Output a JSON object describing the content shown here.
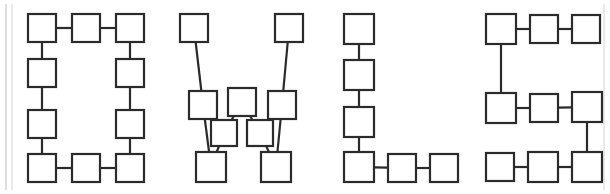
{
  "document": {
    "title": "OWLS node-link letter diagram",
    "caption_text": "OWLS",
    "background_color": "#ffffff",
    "node_fill_color": "#ffffff",
    "node_stroke_color": "#2b2b2b",
    "edge_color": "#2b2b2b",
    "frame_color": "#bdbdbd",
    "stroke_width": 2.2,
    "canvas_width": 610,
    "canvas_height": 194
  },
  "frame": {
    "name": "page-border",
    "left_rule_x": [
      6,
      12
    ],
    "right_rule_x": 604,
    "top_y": 4,
    "bottom_y": 190
  },
  "letters": [
    {
      "id": "letter-o",
      "label": "O",
      "nodes": [
        {
          "id": "o1",
          "x": 28,
          "y": 14,
          "w": 28,
          "h": 28,
          "label": ""
        },
        {
          "id": "o2",
          "x": 72,
          "y": 14,
          "w": 28,
          "h": 28,
          "label": ""
        },
        {
          "id": "o3",
          "x": 116,
          "y": 14,
          "w": 28,
          "h": 28,
          "label": ""
        },
        {
          "id": "o4",
          "x": 28,
          "y": 59,
          "w": 28,
          "h": 28,
          "label": ""
        },
        {
          "id": "o5",
          "x": 116,
          "y": 59,
          "w": 28,
          "h": 28,
          "label": ""
        },
        {
          "id": "o6",
          "x": 28,
          "y": 110,
          "w": 28,
          "h": 28,
          "label": ""
        },
        {
          "id": "o7",
          "x": 116,
          "y": 110,
          "w": 28,
          "h": 28,
          "label": ""
        },
        {
          "id": "o8",
          "x": 28,
          "y": 154,
          "w": 28,
          "h": 28,
          "label": ""
        },
        {
          "id": "o9",
          "x": 72,
          "y": 154,
          "w": 28,
          "h": 28,
          "label": ""
        },
        {
          "id": "o10",
          "x": 116,
          "y": 154,
          "w": 28,
          "h": 28,
          "label": ""
        }
      ],
      "edges": [
        {
          "from": "o1",
          "to": "o2"
        },
        {
          "from": "o2",
          "to": "o3"
        },
        {
          "from": "o1",
          "to": "o4"
        },
        {
          "from": "o4",
          "to": "o6"
        },
        {
          "from": "o6",
          "to": "o8"
        },
        {
          "from": "o8",
          "to": "o9"
        },
        {
          "from": "o9",
          "to": "o10"
        },
        {
          "from": "o3",
          "to": "o5"
        },
        {
          "from": "o5",
          "to": "o7"
        },
        {
          "from": "o7",
          "to": "o10"
        }
      ]
    },
    {
      "id": "letter-w",
      "label": "W",
      "nodes": [
        {
          "id": "w1",
          "x": 180,
          "y": 14,
          "w": 28,
          "h": 28,
          "label": ""
        },
        {
          "id": "w2",
          "x": 275,
          "y": 14,
          "w": 28,
          "h": 28,
          "label": ""
        },
        {
          "id": "w3",
          "x": 189,
          "y": 91,
          "w": 28,
          "h": 28,
          "label": ""
        },
        {
          "id": "w4",
          "x": 228,
          "y": 88,
          "w": 28,
          "h": 28,
          "label": ""
        },
        {
          "id": "w5",
          "x": 268,
          "y": 91,
          "w": 28,
          "h": 28,
          "label": ""
        },
        {
          "id": "w6",
          "x": 211,
          "y": 120,
          "w": 26,
          "h": 26,
          "label": ""
        },
        {
          "id": "w7",
          "x": 247,
          "y": 120,
          "w": 26,
          "h": 26,
          "label": ""
        },
        {
          "id": "w8",
          "x": 196,
          "y": 152,
          "w": 30,
          "h": 30,
          "label": ""
        },
        {
          "id": "w9",
          "x": 261,
          "y": 152,
          "w": 30,
          "h": 30,
          "label": ""
        }
      ],
      "edges": [
        {
          "from": "w1",
          "to": "w3"
        },
        {
          "from": "w3",
          "to": "w8"
        },
        {
          "from": "w8",
          "to": "w6"
        },
        {
          "from": "w6",
          "to": "w4"
        },
        {
          "from": "w4",
          "to": "w7"
        },
        {
          "from": "w7",
          "to": "w9"
        },
        {
          "from": "w9",
          "to": "w5"
        },
        {
          "from": "w5",
          "to": "w2"
        }
      ]
    },
    {
      "id": "letter-l",
      "label": "L",
      "nodes": [
        {
          "id": "l1",
          "x": 344,
          "y": 14,
          "w": 30,
          "h": 30,
          "label": ""
        },
        {
          "id": "l2",
          "x": 344,
          "y": 60,
          "w": 30,
          "h": 30,
          "label": ""
        },
        {
          "id": "l3",
          "x": 344,
          "y": 107,
          "w": 30,
          "h": 30,
          "label": ""
        },
        {
          "id": "l4",
          "x": 344,
          "y": 152,
          "w": 30,
          "h": 30,
          "label": ""
        },
        {
          "id": "l5",
          "x": 388,
          "y": 154,
          "w": 28,
          "h": 28,
          "label": ""
        },
        {
          "id": "l6",
          "x": 430,
          "y": 154,
          "w": 28,
          "h": 28,
          "label": ""
        }
      ],
      "edges": [
        {
          "from": "l1",
          "to": "l2"
        },
        {
          "from": "l2",
          "to": "l3"
        },
        {
          "from": "l3",
          "to": "l4"
        },
        {
          "from": "l4",
          "to": "l5"
        },
        {
          "from": "l5",
          "to": "l6"
        }
      ]
    },
    {
      "id": "letter-s",
      "label": "S",
      "nodes": [
        {
          "id": "s1",
          "x": 486,
          "y": 14,
          "w": 30,
          "h": 30,
          "label": ""
        },
        {
          "id": "s2",
          "x": 530,
          "y": 15,
          "w": 28,
          "h": 28,
          "label": ""
        },
        {
          "id": "s3",
          "x": 572,
          "y": 15,
          "w": 28,
          "h": 28,
          "label": ""
        },
        {
          "id": "s4",
          "x": 486,
          "y": 93,
          "w": 30,
          "h": 30,
          "label": ""
        },
        {
          "id": "s5",
          "x": 530,
          "y": 94,
          "w": 28,
          "h": 28,
          "label": ""
        },
        {
          "id": "s6",
          "x": 572,
          "y": 92,
          "w": 30,
          "h": 30,
          "label": ""
        },
        {
          "id": "s7",
          "x": 486,
          "y": 153,
          "w": 28,
          "h": 28,
          "label": ""
        },
        {
          "id": "s8",
          "x": 528,
          "y": 152,
          "w": 30,
          "h": 30,
          "label": ""
        },
        {
          "id": "s9",
          "x": 572,
          "y": 152,
          "w": 30,
          "h": 30,
          "label": ""
        }
      ],
      "edges": [
        {
          "from": "s1",
          "to": "s2"
        },
        {
          "from": "s2",
          "to": "s3"
        },
        {
          "from": "s1",
          "to": "s4"
        },
        {
          "from": "s4",
          "to": "s5"
        },
        {
          "from": "s5",
          "to": "s6"
        },
        {
          "from": "s6",
          "to": "s9"
        },
        {
          "from": "s9",
          "to": "s8"
        },
        {
          "from": "s8",
          "to": "s7"
        }
      ]
    }
  ]
}
